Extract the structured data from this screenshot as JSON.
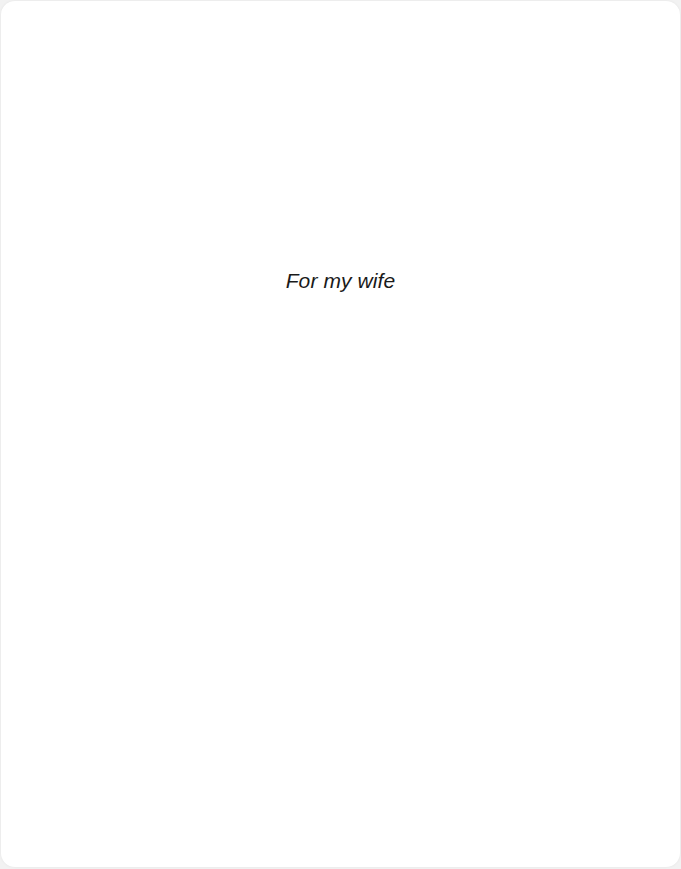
{
  "page": {
    "dedication": "For my wife",
    "background_color": "#ffffff",
    "text_color": "#1a1a1a"
  }
}
